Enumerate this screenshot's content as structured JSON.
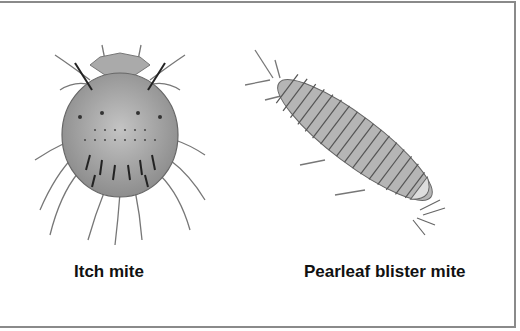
{
  "figures": [
    {
      "id": "itch",
      "label": "Itch mite",
      "icon": "itch-mite-illustration"
    },
    {
      "id": "pearleaf",
      "label": "Pearleaf blister mite",
      "icon": "pearleaf-blister-mite-illustration"
    }
  ],
  "colors": {
    "body": "#9a9a9a",
    "outline": "#555555",
    "border": "#8a8a8a"
  }
}
